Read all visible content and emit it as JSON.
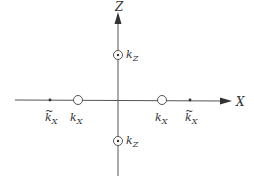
{
  "diagram": {
    "colors": {
      "line": "#555555",
      "text": "#333333",
      "background": "#ffffff"
    },
    "axes": {
      "x": {
        "label": "X"
      },
      "z": {
        "label": "Z"
      }
    },
    "points": {
      "left_tilde": {
        "symbol": "k",
        "subscript": "X",
        "tilde": "~",
        "marker": "dot"
      },
      "left": {
        "symbol": "k",
        "subscript": "X",
        "marker": "open-circle"
      },
      "right": {
        "symbol": "k",
        "subscript": "X",
        "marker": "open-circle"
      },
      "right_tilde": {
        "symbol": "k",
        "subscript": "X",
        "tilde": "~",
        "marker": "dot"
      },
      "top": {
        "symbol": "k",
        "subscript": "Z",
        "marker": "circled-dot"
      },
      "bottom": {
        "symbol": "k",
        "subscript": "Z",
        "marker": "circled-dot"
      }
    }
  }
}
